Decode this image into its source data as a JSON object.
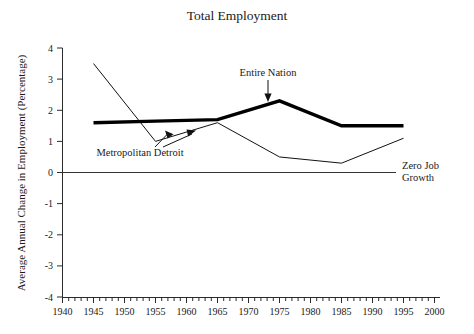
{
  "chart_data": {
    "type": "line",
    "title": "Total Employment",
    "xlabel": "",
    "ylabel": "Average Annual Change in Employment (Percentage)",
    "xlim": [
      1940,
      2000
    ],
    "ylim": [
      -4,
      4
    ],
    "grid": false,
    "legend_position": "inline-annotations",
    "x_ticks": [
      1940,
      1945,
      1950,
      1955,
      1960,
      1965,
      1970,
      1975,
      1980,
      1985,
      1990,
      1995,
      2000
    ],
    "x_tick_labels": [
      "1940",
      "1945",
      "1950",
      "1955",
      "1960",
      "1965",
      "1970",
      "1975",
      "1980",
      "1985",
      "1990",
      "1995",
      "2000"
    ],
    "x_minor_tick_interval": 1,
    "y_ticks": [
      4,
      3,
      2,
      1,
      0,
      -1,
      -2,
      -3,
      -4
    ],
    "y_tick_labels": [
      "4",
      "3",
      "2",
      "1",
      "0",
      "-1",
      "-2",
      "-3",
      "-4"
    ],
    "x": [
      1945,
      1955,
      1965,
      1975,
      1985,
      1995
    ],
    "series": [
      {
        "name": "Entire Nation",
        "style": "thick",
        "values": [
          1.6,
          1.65,
          1.7,
          2.3,
          1.5,
          1.5
        ]
      },
      {
        "name": "Metropolitan Detroit",
        "style": "thin",
        "values": [
          3.5,
          1.0,
          1.6,
          0.5,
          0.3,
          1.1
        ]
      }
    ],
    "annotations": [
      {
        "id": "entire-nation",
        "text": "Entire Nation",
        "points_to_year": 1975,
        "points_to_value": 2.3
      },
      {
        "id": "metropolitan-detroit",
        "text": "Metropolitan Detroit",
        "points_to_year": 1962,
        "points_to_value": 1.4
      },
      {
        "id": "zero-job-growth",
        "text_line1": "Zero Job",
        "text_line2": "Growth",
        "points_to_value": 0
      }
    ]
  },
  "colors": {
    "background": "#ffffff",
    "axis": "#2b2b2b",
    "nation_line": "#000000",
    "detroit_line": "#111111",
    "zero_line": "#333333",
    "text": "#1a1a1a"
  }
}
